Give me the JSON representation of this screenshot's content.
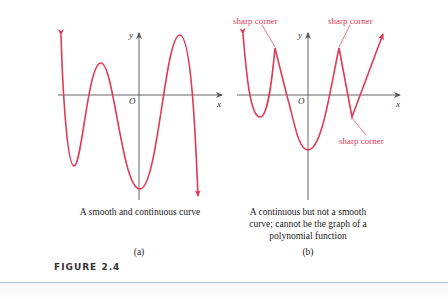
{
  "figure": {
    "title": "FIGURE 2.4",
    "colors": {
      "curve": "#e03a57",
      "axis": "#555555",
      "annotation": "#e03a57",
      "rule": "#b9c3dd"
    },
    "panels": [
      {
        "id": "a",
        "label": "(a)",
        "caption": "A smooth and continuous curve",
        "axes": {
          "x_label": "x",
          "y_label": "y",
          "origin_label": "O"
        }
      },
      {
        "id": "b",
        "label": "(b)",
        "caption_lines": [
          "A continuous but not a smooth",
          "curve; cannot be the graph of a",
          "polynomial function"
        ],
        "axes": {
          "x_label": "x",
          "y_label": "y",
          "origin_label": "O"
        },
        "annotations": [
          "sharp corner",
          "sharp corner",
          "sharp corner"
        ]
      }
    ]
  }
}
